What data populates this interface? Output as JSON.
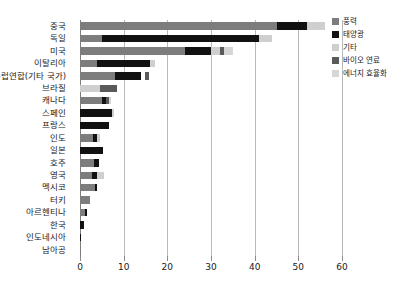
{
  "chart_data": {
    "type": "bar",
    "orientation": "horizontal",
    "stacked": true,
    "title": "",
    "xlabel": "",
    "ylabel": "",
    "xlim": [
      0,
      60
    ],
    "xticks": [
      0,
      10,
      20,
      30,
      40,
      50,
      60
    ],
    "xtick_labels": [
      "0",
      "10",
      "20",
      "30",
      "40",
      "50",
      "60"
    ],
    "grid": true,
    "grid_axis": "x",
    "legend_position": "right-top",
    "categories": [
      "중국",
      "독일",
      "미국",
      "이탈리아",
      "유럽연합(기타 국가)",
      "브라질",
      "캐나다",
      "스페인",
      "프랑스",
      "인도",
      "일본",
      "호주",
      "영국",
      "멕시코",
      "터키",
      "아르헨티나",
      "한국",
      "인도네시아",
      "남아공"
    ],
    "series": [
      {
        "name": "풍력",
        "color": "#7d7d7d",
        "values": [
          45.0,
          5.0,
          24.0,
          4.0,
          8.0,
          0.0,
          5.0,
          0.0,
          0.0,
          3.0,
          0.0,
          3.2,
          2.8,
          3.4,
          2.4,
          1.2,
          0.0,
          0.0,
          0.0
        ]
      },
      {
        "name": "태양광",
        "color": "#111111",
        "values": [
          7.0,
          36.0,
          6.0,
          12.0,
          6.0,
          0.0,
          1.0,
          7.3,
          6.6,
          1.0,
          5.2,
          1.2,
          1.0,
          0.5,
          0.0,
          0.5,
          0.9,
          0.25,
          0.0
        ]
      },
      {
        "name": "기타",
        "color": "#cfcfcf",
        "values": [
          4.0,
          3.0,
          2.0,
          1.2,
          0.0,
          4.5,
          0.0,
          0.5,
          0.0,
          0.6,
          0.0,
          0.0,
          1.6,
          0.0,
          0.0,
          0.0,
          0.0,
          0.0,
          0.0
        ]
      },
      {
        "name": "바이오 연료",
        "color": "#5a5a5a",
        "values": [
          0.0,
          0.0,
          1.0,
          0.0,
          1.1,
          4.0,
          0.7,
          0.0,
          0.0,
          0.0,
          0.0,
          0.0,
          0.0,
          0.0,
          0.0,
          0.0,
          0.0,
          0.0,
          0.0
        ]
      },
      {
        "name": "에너지 효율화",
        "color": "#d6d6d6",
        "values": [
          0.0,
          0.0,
          2.0,
          0.0,
          0.0,
          0.0,
          0.5,
          0.0,
          0.0,
          0.0,
          0.0,
          0.0,
          0.0,
          0.0,
          0.0,
          0.0,
          0.0,
          0.0,
          0.0
        ]
      }
    ],
    "segment_gaps": {
      "유럽연합(기타 국가)": 0.8
    }
  },
  "legend": {
    "items": [
      {
        "label": "풍력",
        "color": "#7d7d7d",
        "swatch": "legend-swatch-wind"
      },
      {
        "label": "태양광",
        "color": "#111111",
        "swatch": "legend-swatch-solar"
      },
      {
        "label": "기타",
        "color": "#cfcfcf",
        "swatch": "legend-swatch-other"
      },
      {
        "label": "바이오 연료",
        "color": "#5a5a5a",
        "swatch": "legend-swatch-biofuel"
      },
      {
        "label": "에너지 효율화",
        "color": "#d6d6d6",
        "swatch": "legend-swatch-efficiency"
      }
    ]
  },
  "axis": {
    "grid_color": "#b9b9b9",
    "axis_color": "#7d7d7d"
  }
}
